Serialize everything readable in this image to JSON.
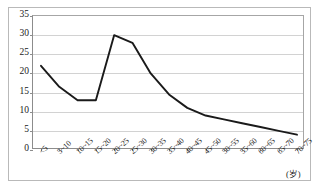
{
  "chart_data": {
    "type": "line",
    "title": "",
    "subtitle": "",
    "xlabel": "(岁)",
    "ylabel": "",
    "grid": true,
    "legend": null,
    "ylim": [
      0,
      35
    ],
    "yticks": [
      0,
      5,
      10,
      15,
      20,
      25,
      30,
      35
    ],
    "ytick_labels": [
      "0",
      "5",
      "10",
      "15",
      "20",
      "25",
      "30",
      "35"
    ],
    "categories": [
      "<5",
      "5~10",
      "10~15",
      "15~20",
      "20~25",
      "25~30",
      "30~35",
      "35~40",
      "40~45",
      "45~50",
      "50~55",
      "55~60",
      "60~65",
      "65~70",
      "70~75"
    ],
    "series": [
      {
        "name": "",
        "color": "#1a1a1a",
        "values": [
          22,
          16.5,
          13,
          13,
          30,
          28,
          20,
          14.5,
          11,
          9,
          8,
          7,
          6,
          5,
          4
        ]
      }
    ],
    "annotations": []
  },
  "axes": {
    "x_unit": "(岁)",
    "y_unit": ""
  },
  "style": {
    "line_color": "#1a1a1a",
    "grid_color": "#d2d2d2",
    "axis_color": "#8c8c8c",
    "frame_color": "#b9b9b9",
    "background": "#ffffff"
  }
}
